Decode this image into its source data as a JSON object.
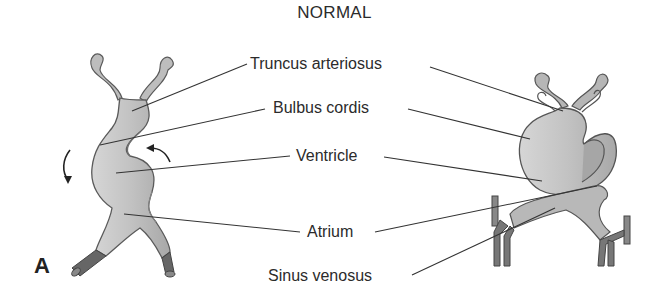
{
  "figure": {
    "title": "NORMAL",
    "panel_letter": "A",
    "labels": [
      {
        "text": "Truncus arteriosus"
      },
      {
        "text": "Bulbus cordis"
      },
      {
        "text": "Ventricle"
      },
      {
        "text": "Atrium"
      },
      {
        "text": "Sinus venosus"
      }
    ],
    "colors": {
      "tissue": "#c4c4c4",
      "tissue_dark": "#8e8e8e",
      "vessel": "#7a7a7a",
      "outline": "#5a5a5a",
      "leader_line": "#333333"
    }
  }
}
